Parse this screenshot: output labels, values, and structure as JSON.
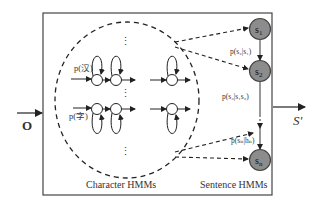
{
  "diagram": {
    "input_label": "O",
    "output_label": "S'",
    "character_group_label": "Character HMMs",
    "sentence_group_label": "Sentence HMMs",
    "character_rows": [
      {
        "label": "p(汉)"
      },
      {
        "label": "p(字)"
      }
    ],
    "vertical_ellipsis": "⋮",
    "sentence_nodes": [
      {
        "id": "s1",
        "base": "s",
        "sub": "1"
      },
      {
        "id": "s2",
        "base": "s",
        "sub": "2"
      },
      {
        "id": "sn",
        "base": "s",
        "sub": "n"
      }
    ],
    "transition_labels": [
      "p(s₂|s₁)",
      "p(s₃|s₁s₂)",
      "p(sₙ|hₙ)"
    ],
    "colors": {
      "line": "#333333",
      "node_fill": "#8c8c8c",
      "node_stroke": "#444444",
      "text": "#333333"
    }
  }
}
